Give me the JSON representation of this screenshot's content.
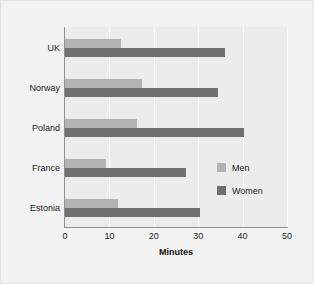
{
  "chart_data": {
    "type": "bar",
    "orientation": "horizontal",
    "title": "",
    "subtitle": "",
    "xlabel": "Minutes",
    "ylabel": "",
    "xlim": [
      0,
      50
    ],
    "xticks": [
      0,
      10,
      20,
      30,
      40,
      50
    ],
    "xtick_labels": [
      "0",
      "10",
      "20",
      "30",
      "40",
      "50"
    ],
    "categories": [
      "UK",
      "Norway",
      "Poland",
      "France",
      "Estonia"
    ],
    "grid": "vertical",
    "legend_position": "right-middle",
    "series": [
      {
        "name": "Men",
        "color": "#b3b3b3",
        "values": [
          12.6,
          17.3,
          16.2,
          9.2,
          12.0
        ]
      },
      {
        "name": "Women",
        "color": "#6f6f6f",
        "values": [
          36.0,
          34.4,
          40.4,
          27.2,
          30.3
        ]
      }
    ]
  },
  "legend": {
    "items": [
      {
        "label": "Men",
        "color": "#b3b3b3"
      },
      {
        "label": "Women",
        "color": "#6f6f6f"
      }
    ]
  },
  "colors": {
    "figure_background": "#f2f2f2",
    "plot_background": "#ececec",
    "axis_line": "#8f8f8f",
    "gridline": "#fbfbfb",
    "text": "#222222"
  }
}
